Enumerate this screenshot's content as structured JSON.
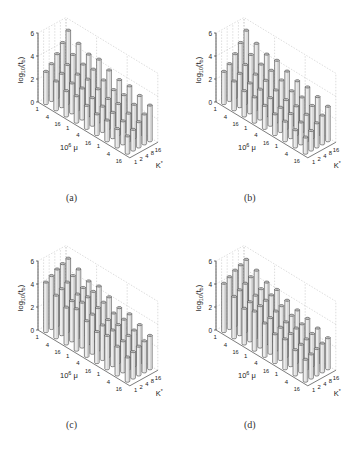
{
  "figure": {
    "panels": [
      {
        "id": "a",
        "caption": "(a)"
      },
      {
        "id": "b",
        "caption": "(b)"
      },
      {
        "id": "c",
        "caption": "(c)"
      },
      {
        "id": "d",
        "caption": "(d)"
      }
    ]
  },
  "chart_data": [
    {
      "type": "bar3d",
      "panel": "(a)",
      "ylabel": "log10(t_b)",
      "xlabel": "10^6 μ",
      "zlabel": "K*",
      "ylim": [
        0,
        6
      ],
      "yticks": [
        0,
        2,
        4,
        6
      ],
      "mu_ticks": [
        "1",
        "4",
        "16",
        "1",
        "4",
        "16",
        "1",
        "4",
        "16"
      ],
      "k_ticks": [
        "1",
        "2",
        "4",
        "8",
        "16"
      ],
      "grid": true,
      "values": [
        [
          2.8,
          3.2,
          3.8,
          4.5,
          5.3
        ],
        [
          2.5,
          2.9,
          3.4,
          4.0,
          4.7
        ],
        [
          2.2,
          2.6,
          3.1,
          3.7,
          4.3
        ],
        [
          2.3,
          2.7,
          3.2,
          3.8,
          4.4
        ],
        [
          2.0,
          2.4,
          2.9,
          3.4,
          4.0
        ],
        [
          1.8,
          2.2,
          2.6,
          3.1,
          3.7
        ],
        [
          1.8,
          2.2,
          2.7,
          3.2,
          3.7
        ],
        [
          1.6,
          2.0,
          2.4,
          2.9,
          3.4
        ],
        [
          1.5,
          1.8,
          2.2,
          2.6,
          3.1
        ]
      ]
    },
    {
      "type": "bar3d",
      "panel": "(b)",
      "ylabel": "log10(t_b)",
      "xlabel": "10^6 μ",
      "zlabel": "K*",
      "ylim": [
        0,
        6
      ],
      "yticks": [
        0,
        2,
        4,
        6
      ],
      "mu_ticks": [
        "1",
        "4",
        "16",
        "1",
        "4",
        "16",
        "1",
        "4",
        "16"
      ],
      "k_ticks": [
        "1",
        "2",
        "4",
        "8",
        "16"
      ],
      "grid": true,
      "values": [
        [
          2.8,
          3.2,
          3.8,
          4.5,
          5.3
        ],
        [
          2.5,
          2.9,
          3.4,
          4.0,
          4.7
        ],
        [
          2.2,
          2.6,
          3.1,
          3.7,
          4.3
        ],
        [
          2.2,
          2.6,
          3.1,
          3.7,
          4.3
        ],
        [
          2.0,
          2.4,
          2.8,
          3.4,
          3.9
        ],
        [
          1.8,
          2.1,
          2.5,
          3.0,
          3.6
        ],
        [
          1.7,
          2.1,
          2.5,
          3.0,
          3.6
        ],
        [
          1.5,
          1.9,
          2.3,
          2.8,
          3.3
        ],
        [
          1.4,
          1.7,
          2.1,
          2.5,
          3.0
        ]
      ]
    },
    {
      "type": "bar3d",
      "panel": "(c)",
      "ylabel": "log10(t_b)",
      "xlabel": "10^6 μ",
      "zlabel": "K*",
      "ylim": [
        0,
        6
      ],
      "yticks": [
        0,
        2,
        4,
        6
      ],
      "mu_ticks": [
        "1",
        "4",
        "16",
        "1",
        "4",
        "16",
        "1",
        "4",
        "16"
      ],
      "k_ticks": [
        "1",
        "2",
        "4",
        "8",
        "16"
      ],
      "grid": true,
      "values": [
        [
          4.3,
          4.6,
          4.9,
          5.1,
          5.3
        ],
        [
          3.7,
          4.0,
          4.3,
          4.6,
          4.9
        ],
        [
          3.2,
          3.5,
          3.8,
          4.1,
          4.4
        ],
        [
          3.6,
          3.9,
          4.1,
          4.3,
          4.5
        ],
        [
          3.1,
          3.4,
          3.7,
          3.9,
          4.1
        ],
        [
          2.7,
          3.0,
          3.2,
          3.5,
          3.7
        ],
        [
          2.9,
          3.1,
          3.3,
          3.5,
          3.7
        ],
        [
          2.5,
          2.7,
          2.9,
          3.1,
          3.3
        ],
        [
          2.1,
          2.3,
          2.5,
          2.7,
          2.9
        ]
      ]
    },
    {
      "type": "bar3d",
      "panel": "(d)",
      "ylabel": "log10(t_b)",
      "xlabel": "10^6 μ",
      "zlabel": "K*",
      "ylim": [
        0,
        6
      ],
      "yticks": [
        0,
        2,
        4,
        6
      ],
      "mu_ticks": [
        "1",
        "4",
        "16",
        "1",
        "4",
        "16",
        "1",
        "4",
        "16"
      ],
      "k_ticks": [
        "1",
        "2",
        "4",
        "8",
        "16"
      ],
      "grid": true,
      "values": [
        [
          4.2,
          4.5,
          4.8,
          5.0,
          5.2
        ],
        [
          3.6,
          3.9,
          4.2,
          4.5,
          4.8
        ],
        [
          3.1,
          3.4,
          3.7,
          4.0,
          4.3
        ],
        [
          3.4,
          3.6,
          3.8,
          4.0,
          4.2
        ],
        [
          2.9,
          3.1,
          3.4,
          3.6,
          3.8
        ],
        [
          2.5,
          2.8,
          3.0,
          3.3,
          3.5
        ],
        [
          2.6,
          2.8,
          3.0,
          3.1,
          3.3
        ],
        [
          2.2,
          2.4,
          2.6,
          2.8,
          3.0
        ],
        [
          1.9,
          2.1,
          2.3,
          2.5,
          2.7
        ]
      ]
    }
  ]
}
